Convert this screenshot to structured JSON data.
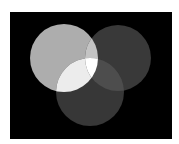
{
  "figure": {
    "type": "three-circle-venn-overlap",
    "background_color": "#ffffff",
    "panel": {
      "x": 10,
      "y": 12,
      "width": 162,
      "height": 127,
      "color": "#000000"
    },
    "circles": [
      {
        "name": "left",
        "cx": 64,
        "cy": 58,
        "r": 34,
        "color": "#adadad"
      },
      {
        "name": "right",
        "cx": 118,
        "cy": 58,
        "r": 33,
        "color": "#393939"
      },
      {
        "name": "bottom",
        "cx": 90,
        "cy": 92,
        "r": 34,
        "color": "#373737"
      }
    ],
    "overlaps": {
      "left_right": "#c4c4c4",
      "left_bottom": "#ececec",
      "right_bottom": "#4d4d4d",
      "all_three": "#ffffff"
    }
  }
}
